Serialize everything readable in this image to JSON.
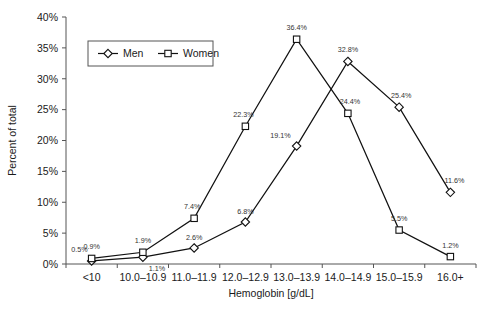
{
  "chart_data": {
    "type": "line",
    "title": "",
    "xlabel": "Hemoglobin [g/dL]",
    "ylabel": "Percent of total",
    "categories": [
      "<10",
      "10.0–10.9",
      "11.0–11.9",
      "12.0–12.9",
      "13.0–13.9",
      "14.0–14.9",
      "15.0–15.9",
      "16.0+"
    ],
    "series": [
      {
        "name": "Men",
        "marker": "diamond",
        "values": [
          0.5,
          1.1,
          2.6,
          6.8,
          19.1,
          32.8,
          25.4,
          11.6
        ],
        "labels": [
          "0.5%",
          "1.1%",
          "2.6%",
          "6.8%",
          "19.1%",
          "32.8%",
          "25.4%",
          "11.6%"
        ]
      },
      {
        "name": "Women",
        "marker": "square",
        "values": [
          0.9,
          1.9,
          7.4,
          22.3,
          36.4,
          24.4,
          5.5,
          1.2
        ],
        "labels": [
          "0.9%",
          "1.9%",
          "7.4%",
          "22.3%",
          "36.4%",
          "24.4%",
          "5.5%",
          "1.2%"
        ]
      }
    ],
    "ylim": [
      0,
      40
    ],
    "yticks": [
      0,
      5,
      10,
      15,
      20,
      25,
      30,
      35,
      40
    ],
    "yticklabels": [
      "0%",
      "5%",
      "10%",
      "15%",
      "20%",
      "25%",
      "30%",
      "35%",
      "40%"
    ],
    "grid": false,
    "legend_position": "top-left",
    "colors": {
      "line": "#111111",
      "marker_fill": "#ffffff",
      "axis": "#555555"
    }
  }
}
